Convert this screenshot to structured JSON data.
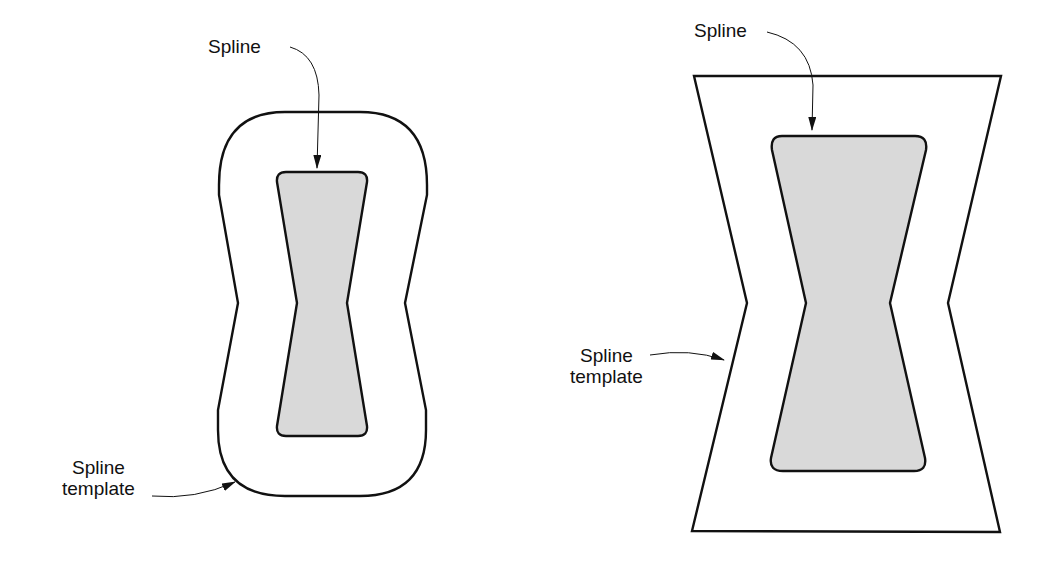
{
  "figures": [
    {
      "id": "left",
      "description": "Rounded spline template surrounding hourglass spline",
      "spline_label": "Spline",
      "template_label_line1": "Spline",
      "template_label_line2": "template"
    },
    {
      "id": "right",
      "description": "Polygonal spline template surrounding hourglass spline",
      "spline_label": "Spline",
      "template_label_line1": "Spline",
      "template_label_line2": "template"
    }
  ],
  "colors": {
    "stroke": "#111111",
    "spline_fill": "#d9d9d9",
    "background": "#ffffff"
  }
}
